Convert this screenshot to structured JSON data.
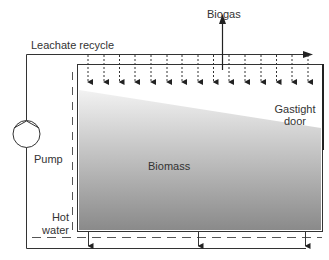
{
  "diagram": {
    "labels": {
      "biogas": "Biogas",
      "leachate_recycle": "Leachate recycle",
      "gastight_door_line1": "Gastight",
      "gastight_door_line2": "door",
      "pump": "Pump",
      "biomass": "Biomass",
      "hot_water_line1": "Hot",
      "hot_water_line2": "water"
    },
    "components": [
      "leachate recycle line",
      "pump",
      "sprinkler arrows",
      "reactor tank",
      "biomass",
      "gastight door",
      "hot water heating",
      "leachate drains",
      "biogas outlet"
    ],
    "colors": {
      "line": "#333333",
      "biomass_light": "#eeeeee",
      "biomass_dark": "#8a8a8a",
      "text": "#333333"
    }
  }
}
